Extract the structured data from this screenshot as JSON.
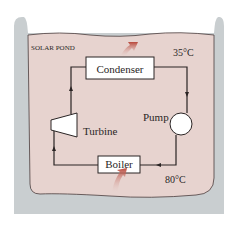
{
  "diagram": {
    "pond_label": "SOLAR POND",
    "top_temperature": "35°C",
    "bottom_temperature": "80°C",
    "components": {
      "condenser": "Condenser",
      "turbine": "Turbine",
      "pump": "Pump",
      "boiler": "Boiler"
    },
    "colors": {
      "container_gray": "#c9ced0",
      "pond_pink": "#e7d3cf",
      "heat_arrow": "#b8473a",
      "line": "#2a2424",
      "box_fill": "#ffffff"
    }
  }
}
